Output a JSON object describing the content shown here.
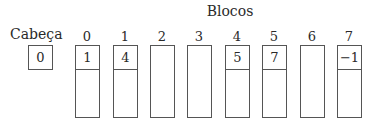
{
  "title": "Blocos",
  "head": {
    "label": "Cabeça",
    "value": "0"
  },
  "blocks": [
    {
      "index": "0",
      "next": "1",
      "used": true,
      "left": 75
    },
    {
      "index": "1",
      "next": "4",
      "used": true,
      "left": 113
    },
    {
      "index": "2",
      "next": "",
      "used": false,
      "left": 150
    },
    {
      "index": "3",
      "next": "",
      "used": false,
      "left": 187
    },
    {
      "index": "4",
      "next": "5",
      "used": true,
      "left": 225
    },
    {
      "index": "5",
      "next": "7",
      "used": true,
      "left": 262
    },
    {
      "index": "6",
      "next": "",
      "used": false,
      "left": 300
    },
    {
      "index": "7",
      "next": "−1",
      "used": true,
      "left": 337
    }
  ]
}
